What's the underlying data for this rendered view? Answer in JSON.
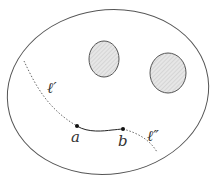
{
  "figure": {
    "colors": {
      "stroke": "#555555",
      "hole_fill": "#e6e6e6",
      "hatch": "#bdbdbd",
      "point": "#111111",
      "label": "#333333"
    },
    "labels": {
      "point_a": "a",
      "point_b": "b",
      "curve_left": "ℓ′",
      "curve_right": "ℓ″"
    }
  }
}
